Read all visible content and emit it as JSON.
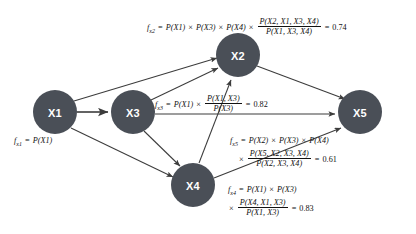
{
  "diagram": {
    "type": "directed-graph",
    "title": "",
    "node_fill": "#4a4f57",
    "node_text_color": "#ffffff",
    "edge_color": "#3c3c3c",
    "background": "#ffffff",
    "nodes": [
      {
        "id": "X1",
        "label": "X1",
        "cx": 55,
        "cy": 112,
        "r": 22
      },
      {
        "id": "X2",
        "label": "X2",
        "cx": 238,
        "cy": 55,
        "r": 22
      },
      {
        "id": "X3",
        "label": "X3",
        "cx": 133,
        "cy": 112,
        "r": 22
      },
      {
        "id": "X4",
        "label": "X4",
        "cx": 193,
        "cy": 185,
        "r": 22
      },
      {
        "id": "X5",
        "label": "X5",
        "cx": 360,
        "cy": 112,
        "r": 22
      }
    ],
    "edges": [
      {
        "from": "X1",
        "to": "X2"
      },
      {
        "from": "X1",
        "to": "X3"
      },
      {
        "from": "X1",
        "to": "X4"
      },
      {
        "from": "X3",
        "to": "X2"
      },
      {
        "from": "X3",
        "to": "X4"
      },
      {
        "from": "X3",
        "to": "X5"
      },
      {
        "from": "X4",
        "to": "X2"
      },
      {
        "from": "X4",
        "to": "X5"
      },
      {
        "from": "X2",
        "to": "X5"
      }
    ]
  },
  "formulas": {
    "x1": {
      "name": "f",
      "subscript": "x1",
      "equals": "=",
      "term1": "P(X1)"
    },
    "x2": {
      "name": "f",
      "subscript": "x2",
      "equals": "=",
      "term1": "P(X1)",
      "mul1": "×",
      "term2": "P(X3)",
      "mul2": "×",
      "term3": "P(X4)",
      "mul3": "×",
      "frac_num": "P(X2, X1, X3, X4)",
      "frac_den": "P(X1, X3, X4)",
      "eq2": "=",
      "value": "0.74"
    },
    "x3": {
      "name": "f",
      "subscript": "x3",
      "equals": "=",
      "term1": "P(X1)",
      "mul1": "×",
      "frac_num": "P(X1, X3)",
      "frac_den": "P(X3)",
      "eq2": "=",
      "value": "0.82"
    },
    "x4": {
      "name": "f",
      "subscript": "x4",
      "equals": "=",
      "term1": "P(X1)",
      "mul1": "×",
      "term2": "P(X3)",
      "mul2": "×",
      "frac_num": "P(X4, X1, X3)",
      "frac_den": "P(X1, X3)",
      "eq2": "=",
      "value": "0.83"
    },
    "x5": {
      "name": "f",
      "subscript": "x5",
      "equals": "=",
      "term1": "P(X2)",
      "mul1": "×",
      "term2": "P(X3)",
      "mul2": "×",
      "term3": "P(X4)",
      "mul3": "×",
      "frac_num": "P(X5, X2, X3, X4)",
      "frac_den": "P(X2, X3, X4)",
      "eq2": "=",
      "value": "0.61"
    }
  }
}
